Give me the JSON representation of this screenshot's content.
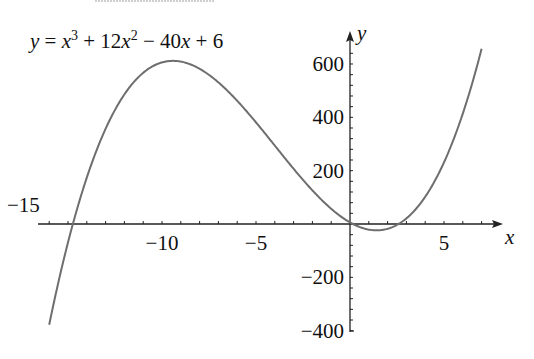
{
  "chart_data": {
    "type": "line",
    "title_parts": {
      "y": "y",
      "eq": "=",
      "x1": "x",
      "e1": "3",
      "plus1": "+ 12",
      "x2": "x",
      "e2": "2",
      "minus": "− 40",
      "x3": "x",
      "plus2": "+ 6"
    },
    "xlabel": "x",
    "ylabel": "y",
    "function": "x^3 + 12x^2 - 40x + 6",
    "x_range": [
      -16,
      7
    ],
    "xlim": [
      -16.5,
      8
    ],
    "ylim": [
      -400,
      650
    ],
    "x_ticks": [
      -10,
      -5,
      5
    ],
    "x_tick_labels": [
      "−10",
      "−5",
      "5"
    ],
    "x_annotation": "−15",
    "y_ticks": [
      600,
      400,
      200,
      -200,
      -400
    ],
    "y_tick_labels": [
      "600",
      "400",
      "200",
      "−200",
      "−400"
    ],
    "x_minor_tick_step": 1,
    "y_minor_tick_step": 40,
    "grid": false,
    "line_color": "#6e6e6e",
    "axis_color": "#222222",
    "key_points": [
      {
        "x": -16,
        "y": -378
      },
      {
        "x": -15,
        "y": -69
      },
      {
        "x": -9.46,
        "y": 612
      },
      {
        "x": 0,
        "y": 6
      },
      {
        "x": 1.41,
        "y": -23
      },
      {
        "x": 7,
        "y": 657
      }
    ]
  }
}
